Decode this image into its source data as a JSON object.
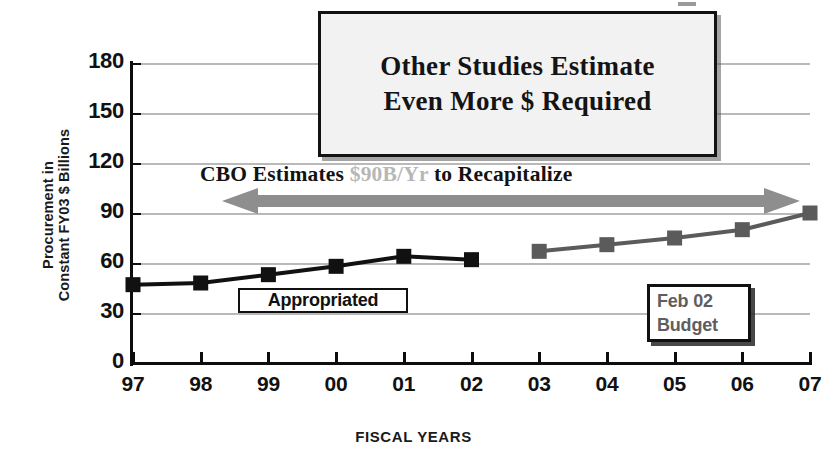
{
  "chart_data": {
    "type": "line",
    "title": "",
    "xlabel": "FISCAL YEARS",
    "ylabel": "Procurement in Constant FY03 $ Billions",
    "ylabel_line1": "Procurement in",
    "ylabel_line2": "Constant FY03 $ Billions",
    "categories": [
      "97",
      "98",
      "99",
      "00",
      "01",
      "02",
      "03",
      "04",
      "05",
      "06",
      "07"
    ],
    "x_tick_labels": [
      "97",
      "98",
      "99",
      "00",
      "01",
      "02",
      "03",
      "04",
      "05",
      "06",
      "07"
    ],
    "y_tick_labels": [
      "180",
      "150",
      "120",
      "90",
      "60",
      "30",
      "0"
    ],
    "y_tick_values": [
      180,
      150,
      120,
      90,
      60,
      30,
      0
    ],
    "ylim": [
      0,
      180
    ],
    "grid": true,
    "legend_position": "none",
    "series": [
      {
        "name": "Appropriated",
        "color": "#111111",
        "marker": "square",
        "x": [
          "97",
          "98",
          "99",
          "00",
          "01",
          "02"
        ],
        "values": [
          47,
          48,
          53,
          58,
          64,
          62
        ]
      },
      {
        "name": "Feb 02 Budget",
        "color": "#5b5b5b",
        "marker": "square",
        "x": [
          "03",
          "04",
          "05",
          "06",
          "07"
        ],
        "values": [
          67,
          71,
          75,
          80,
          90
        ]
      }
    ],
    "annotations": [
      {
        "name": "other-studies-callout",
        "line1": "Other Studies Estimate",
        "line2": "Even More $ Required"
      },
      {
        "name": "cbo-arrow-label",
        "text_before": "CBO Estimates ",
        "text_highlight": "$90B/Yr",
        "text_after": " to Recapitalize",
        "arrow": "double-headed",
        "arrow_color": "#8e8e8e",
        "at_value": 90
      },
      {
        "name": "appropriated-label",
        "text": "Appropriated"
      },
      {
        "name": "feb-02-budget-label",
        "line1": "Feb 02",
        "line2": "Budget"
      }
    ],
    "colors": {
      "appropriated_series": "#111111",
      "budget_series": "#5b5b5b",
      "arrow": "#8e8e8e",
      "gridline": "#b9b9b9",
      "axis": "#0d0d0d",
      "callout_fill": "#f2f2f2",
      "dim_text": "#b7b7b7"
    }
  },
  "callout": {
    "line1": "Other Studies Estimate",
    "line2": "Even More $ Required"
  },
  "cbo": {
    "before": "CBO Estimates ",
    "highlight": "$90B/Yr",
    "after": " to Recapitalize"
  },
  "appropriated": {
    "label": "Appropriated"
  },
  "budget": {
    "line1": "Feb 02",
    "line2": "Budget"
  },
  "axes": {
    "x_title": "FISCAL YEARS",
    "y_title_line1": "Procurement in",
    "y_title_line2": "Constant FY03 $ Billions"
  }
}
